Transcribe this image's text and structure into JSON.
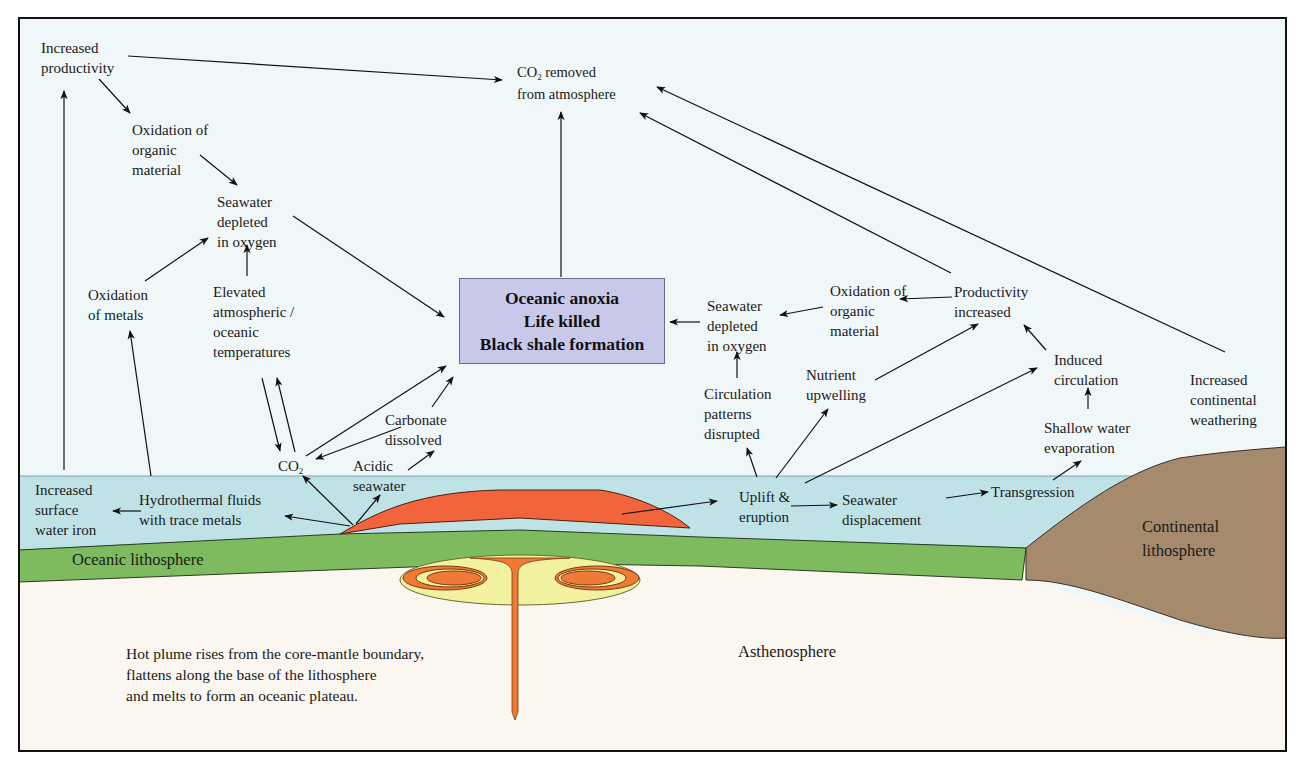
{
  "figure": {
    "frame": {
      "x": 19,
      "y": 18,
      "width": 1267,
      "height": 733
    },
    "colors": {
      "sky": "#f0f7f8",
      "seawater": "#bfe2e6",
      "oceanic_lithosphere": "#7dbb5e",
      "continental_lithosphere": "#a58a6e",
      "asthenosphere": "#fbf6ef",
      "plateau_basalt": "#f2643c",
      "plume_head": "#f1f1a0",
      "plume_core": "#ee7a35",
      "central_box": "#c8c9ea",
      "ink": "#1a1a1a"
    },
    "central_box": {
      "lines": [
        "Oceanic anoxia",
        "Life killed",
        "Black shale formation"
      ]
    },
    "top": {
      "co2_removed": {
        "prefix": "CO",
        "sub": "2",
        "line1_rest": " removed",
        "line2": "from atmosphere"
      }
    },
    "left_chain": {
      "increased_productivity": [
        "Increased",
        "productivity"
      ],
      "oxidation_organic": [
        "Oxidation of",
        "organic",
        "material"
      ],
      "seawater_depleted": [
        "Seawater",
        "depleted",
        "in oxygen"
      ],
      "oxidation_metals": [
        "Oxidation",
        "of metals"
      ],
      "elevated_temps": [
        "Elevated",
        "atmospheric /",
        "oceanic",
        "temperatures"
      ],
      "co2": {
        "prefix": "CO",
        "sub": "2"
      },
      "carbonate_dissolved": [
        "Carbonate",
        "dissolved"
      ],
      "acidic_seawater": [
        "Acidic",
        "seawater"
      ],
      "hydrothermal_fluids": [
        "Hydrothermal fluids",
        "with trace metals"
      ],
      "surface_iron": [
        "Increased",
        "surface",
        "water iron"
      ]
    },
    "right_chain": {
      "seawater_depleted": [
        "Seawater",
        "depleted",
        "in oxygen"
      ],
      "oxidation_organic": [
        "Oxidation of",
        "organic",
        "material"
      ],
      "productivity_increased": [
        "Productivity",
        "increased"
      ],
      "circulation_disrupted": [
        "Circulation",
        "patterns",
        "disrupted"
      ],
      "nutrient_upwelling": [
        "Nutrient",
        "upwelling"
      ],
      "induced_circulation": [
        "Induced",
        "circulation"
      ],
      "continental_weathering": [
        "Increased",
        "continental",
        "weathering"
      ],
      "shallow_evaporation": [
        "Shallow water",
        "evaporation"
      ],
      "uplift_eruption": [
        "Uplift &",
        "eruption"
      ],
      "seawater_displacement": [
        "Seawater",
        "displacement"
      ],
      "transgression": [
        "Transgression"
      ]
    },
    "layers": {
      "oceanic_lithosphere": "Oceanic lithosphere",
      "continental_lithosphere": [
        "Continental",
        "lithosphere"
      ],
      "asthenosphere": "Asthenosphere"
    },
    "caption_in_figure": [
      "Hot plume rises from the core-mantle boundary,",
      "flattens along the base of the lithosphere",
      "and melts to form an oceanic plateau."
    ]
  }
}
